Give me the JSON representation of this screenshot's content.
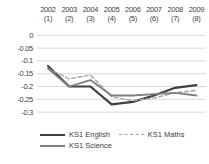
{
  "chart_data": {
    "type": "line",
    "title": "",
    "xlabel": "",
    "ylabel": "",
    "grid": true,
    "legend_position": "bottom",
    "ylim": [
      -0.3,
      0
    ],
    "categories": [
      {
        "year": "2002",
        "rank": "(1)"
      },
      {
        "year": "2003",
        "rank": "(2)"
      },
      {
        "year": "2004",
        "rank": "(3)"
      },
      {
        "year": "2005",
        "rank": "(4)"
      },
      {
        "year": "2006",
        "rank": "(5)"
      },
      {
        "year": "2007",
        "rank": "(6)"
      },
      {
        "year": "2008",
        "rank": "(7)"
      },
      {
        "year": "2009",
        "rank": "(8)"
      }
    ],
    "yticks": [
      "0",
      "-0.05",
      "-0.1",
      "-0.15",
      "-0.2",
      "-0.25",
      "-0.3"
    ],
    "ytick_values": [
      0,
      -0.05,
      -0.1,
      -0.15,
      -0.2,
      -0.25,
      -0.3
    ],
    "series": [
      {
        "name": "KS1 English",
        "color": "#3f3f3f",
        "dash": null,
        "width": 2.2,
        "values": [
          -0.12,
          -0.2,
          -0.2,
          -0.27,
          -0.26,
          -0.235,
          -0.205,
          -0.195
        ]
      },
      {
        "name": "KS1 Maths",
        "color": "#a6a6a6",
        "dash": "4 2.5",
        "width": 1.4,
        "values": [
          -0.13,
          -0.17,
          -0.155,
          -0.24,
          -0.255,
          -0.245,
          -0.225,
          -0.215
        ]
      },
      {
        "name": "KS1 Science",
        "color": "#7f7f7f",
        "dash": null,
        "width": 1.8,
        "values": [
          -0.13,
          -0.2,
          -0.175,
          -0.235,
          -0.235,
          -0.23,
          -0.225,
          -0.235
        ]
      }
    ],
    "gridline_color": "#d9d9d9",
    "text_color": "#404040"
  },
  "legend": {
    "items": [
      {
        "label": "KS1 English"
      },
      {
        "label": "KS1 Maths"
      },
      {
        "label": "KS1 Science"
      }
    ]
  }
}
